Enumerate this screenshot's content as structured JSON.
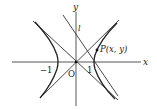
{
  "figure": {
    "colors": {
      "stroke": "#333333",
      "background": "#ffffff"
    },
    "labels": {
      "x_axis": "x",
      "y_axis": "y",
      "origin": "O",
      "line": "l",
      "point": "P(x, y)",
      "tick_neg": "−1",
      "tick_pos": "1"
    }
  }
}
